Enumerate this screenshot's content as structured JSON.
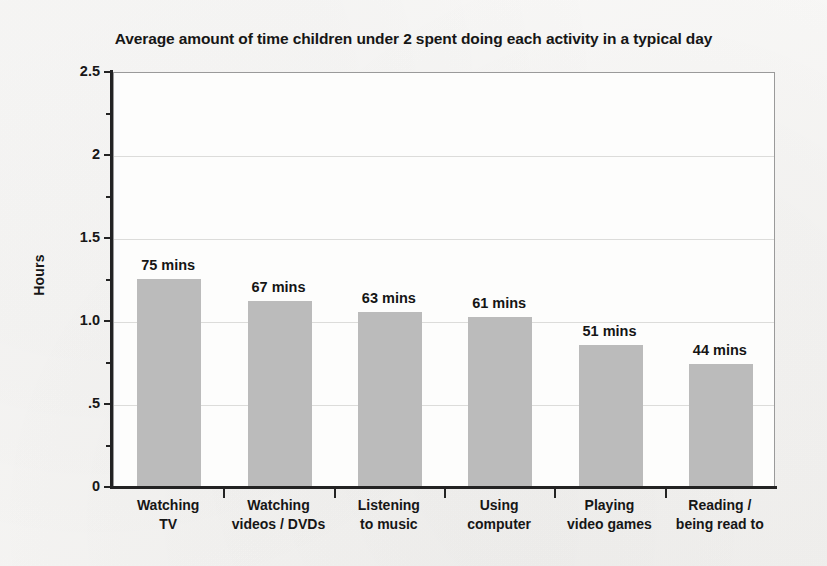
{
  "chart_data": {
    "type": "bar",
    "title": "Average amount of time children under 2 spent doing each activity in a typical day",
    "xlabel": "",
    "ylabel": "Hours",
    "ylim": [
      0,
      2.5
    ],
    "grid": true,
    "legend": "none",
    "categories": [
      "Watching TV",
      "Watching videos / DVDs",
      "Listening to music",
      "Using computer",
      "Playing video games",
      "Reading / being read to"
    ],
    "category_lines": [
      [
        "Watching",
        "TV"
      ],
      [
        "Watching",
        "videos / DVDs"
      ],
      [
        "Listening",
        "to music"
      ],
      [
        "Using",
        "computer"
      ],
      [
        "Playing",
        "video games"
      ],
      [
        "Reading /",
        "being read to"
      ]
    ],
    "values": [
      1.25,
      1.117,
      1.05,
      1.017,
      0.85,
      0.733
    ],
    "value_labels": [
      "75 mins",
      "67 mins",
      "63 mins",
      "61 mins",
      "51 mins",
      "44 mins"
    ],
    "minutes": [
      75,
      67,
      63,
      61,
      51,
      44
    ],
    "y_ticks": [
      {
        "value": 2.5,
        "label": "2.5",
        "major": true
      },
      {
        "value": 2.25,
        "label": "",
        "major": false
      },
      {
        "value": 2,
        "label": "2",
        "major": true
      },
      {
        "value": 1.75,
        "label": "",
        "major": false
      },
      {
        "value": 1.5,
        "label": "1.5",
        "major": true
      },
      {
        "value": 1.25,
        "label": "",
        "major": false
      },
      {
        "value": 1.0,
        "label": "1.0",
        "major": true
      },
      {
        "value": 0.75,
        "label": "",
        "major": false
      },
      {
        "value": 0.5,
        "label": ".5",
        "major": true
      },
      {
        "value": 0.25,
        "label": "",
        "major": false
      },
      {
        "value": 0,
        "label": "0",
        "major": true
      }
    ],
    "gridline_values": [
      2.5,
      2,
      1.5,
      1.0,
      0.5
    ],
    "colors": {
      "bar_fill": "#bbbbbb",
      "axis": "#232323",
      "gridline": "#dcdcda",
      "plot_background": "#fdfdfc",
      "page_background": "#f5f4f2",
      "text": "#161616"
    }
  }
}
